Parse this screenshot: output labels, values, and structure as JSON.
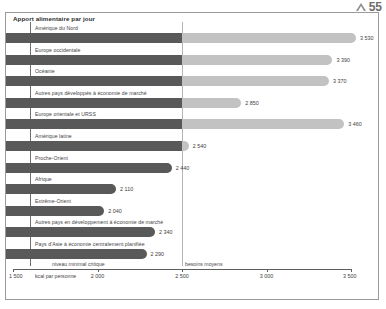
{
  "page": {
    "folio": "55",
    "marker_icon": "triangle-icon"
  },
  "chart_data": {
    "type": "bar",
    "orientation": "horizontal",
    "title": "Apport alimentaire par jour",
    "xlabel": "kcal par personne",
    "ylabel": "",
    "xlim": [
      1500,
      3500
    ],
    "xticks": [
      1500,
      2000,
      2500,
      3000,
      3500
    ],
    "xticklabels": [
      "1 500",
      "2 000",
      "2 500",
      "3 000",
      "3 500"
    ],
    "grid": false,
    "categories": [
      "Amérique du Nord",
      "Europe occidentale",
      "Océanie",
      "Autres pays développés à économie de marché",
      "Europe orientale et URSS",
      "Amérique latine",
      "Proche-Orient",
      "Afrique",
      "Extrême-Orient",
      "Autres pays en développement à économie de marché",
      "Pays d'Asie à économie centralement planifiée"
    ],
    "values": [
      3530,
      3390,
      3370,
      2850,
      3460,
      2540,
      2440,
      2110,
      2040,
      2340,
      2290
    ],
    "value_labels": [
      "3 530",
      "3 390",
      "3 370",
      "2 850",
      "3 460",
      "2 540",
      "2 440",
      "2 110",
      "2 040",
      "2 340",
      "2 290"
    ],
    "reference_lines": [
      {
        "label": "niveau minimal critique",
        "value": 1600
      },
      {
        "label": "besoins moyens",
        "value": 2500
      }
    ],
    "segment_split_value": 2500,
    "colors": {
      "bar_low": "#595959",
      "bar_high": "#c2c2c2",
      "frame": "#9a9a9a",
      "axis": "#5d5d5d",
      "text": "#3d3d3d"
    }
  }
}
